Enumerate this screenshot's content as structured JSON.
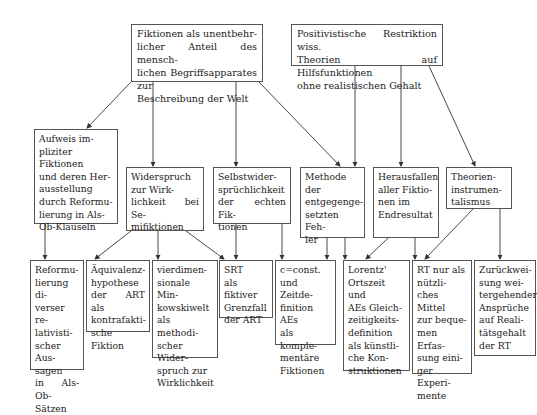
{
  "diagram": {
    "type": "concept-tree",
    "top_nodes": [
      {
        "id": "fiktionen",
        "text": "Fiktionen als unentbehr-\nlicher Anteil des mensch-\nlichen Begriffsapparates zur\nBeschreibung der Welt"
      },
      {
        "id": "positivistische",
        "text": "Positivistische Restriktion wiss.\nTheorien auf Hilfsfunktionen\nohne realistischen Gehalt"
      }
    ],
    "middle_nodes": [
      {
        "id": "aufweis",
        "text": "Aufweis im-\npliziter Fiktionen\nund deren Her-\nausstellung\ndurch Reformu-\nlierung in Als-\nOb-Klauseln"
      },
      {
        "id": "widerspruch",
        "text": "Widerspruch\nzur Wirk-\nlichkeit bei Se-\nmifiktionen"
      },
      {
        "id": "selbstwider",
        "text": "Selbstwider-\nsprüchlichkeit\nder echten Fik-\ntionen"
      },
      {
        "id": "methode",
        "text": "Methode der\nentgegenge-\nsetzten Feh-\nler"
      },
      {
        "id": "herausfallen",
        "text": "Herausfallen\naller Fiktio-\nnen im\nEndresultat"
      },
      {
        "id": "theorien",
        "text": "Theorien-\ninstrumen-\ntalismus"
      }
    ],
    "bottom_nodes": [
      {
        "id": "reformulierung",
        "text": "Reformu-\nlierung di-\nverser re-\nlativisti-\nscher Aus-\nsagen\nin Als-Ob-\nSätzen"
      },
      {
        "id": "aequivalenz",
        "text": "Äquivalenz-\nhypothese\nder ART als\nkontrafakti-\nsche Fiktion"
      },
      {
        "id": "vierdim",
        "text": "vierdimen-\nsionale Min-\nkowskiwelt\nals methodi-\nscher Wider-\nspruch zur\nWirklichkeit"
      },
      {
        "id": "srt",
        "text": "SRT\nals fiktiver\nGrenzfall\nder ART"
      },
      {
        "id": "cconst",
        "text": "c=const.\nund Zeitde-\nfinition AEs\nals komple-\nmentäre\nFiktionen"
      },
      {
        "id": "lorentz",
        "text": "Lorentz'\nOrtszeit und\nAEs Gleich-\nzeitigkeits-\ndefinition\nals künstli-\nche Kon-\nstruktionen"
      },
      {
        "id": "rt",
        "text": "RT nur als\nnützli-\nches Mittel\nzur beque-\nmen Erfas-\nsung eini-\nger Experi-\nmente"
      },
      {
        "id": "zurueck",
        "text": "Zurückwei-\nsung wei-\ntergehender\nAnsprüche\nauf Reali-\ntätsgehalt\nder RT"
      }
    ],
    "edges": [
      [
        "fiktionen",
        "aufweis"
      ],
      [
        "fiktionen",
        "widerspruch"
      ],
      [
        "fiktionen",
        "selbstwider"
      ],
      [
        "fiktionen",
        "methode"
      ],
      [
        "positivistische",
        "methode"
      ],
      [
        "positivistische",
        "herausfallen"
      ],
      [
        "positivistische",
        "theorien"
      ],
      [
        "aufweis",
        "reformulierung"
      ],
      [
        "widerspruch",
        "aequivalenz"
      ],
      [
        "widerspruch",
        "vierdim"
      ],
      [
        "widerspruch",
        "srt"
      ],
      [
        "selbstwider",
        "srt"
      ],
      [
        "selbstwider",
        "cconst"
      ],
      [
        "methode",
        "cconst"
      ],
      [
        "methode",
        "lorentz"
      ],
      [
        "herausfallen",
        "lorentz"
      ],
      [
        "herausfallen",
        "rt"
      ],
      [
        "theorien",
        "rt"
      ],
      [
        "theorien",
        "zurueck"
      ]
    ]
  }
}
